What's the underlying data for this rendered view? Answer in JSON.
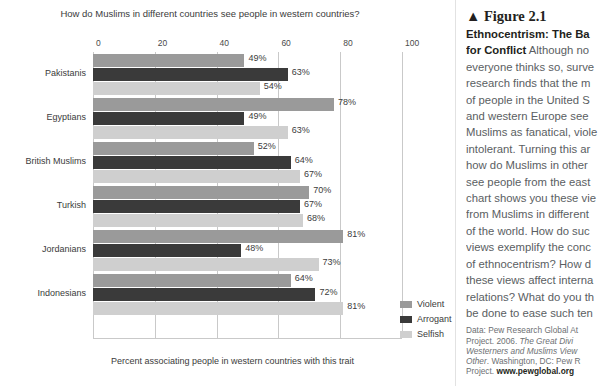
{
  "chart_data": {
    "type": "bar",
    "orientation": "horizontal",
    "title": "How do Muslims in different countries see people in western countries?",
    "xlabel": "Percent associating people in western countries with this trait",
    "ylabel": "",
    "xlim": [
      0,
      100
    ],
    "xticks": [
      0,
      20,
      40,
      60,
      80,
      100
    ],
    "xtick_labels": [
      "0",
      "20",
      "40",
      "60",
      "80",
      "100"
    ],
    "grid": true,
    "legend_position": "right-bottom",
    "categories": [
      "Pakistanis",
      "Egyptians",
      "British Muslims",
      "Turkish",
      "Jordanians",
      "Indonesians"
    ],
    "series": [
      {
        "name": "Violent",
        "color": "#9a9a9a",
        "values": [
          49,
          78,
          52,
          70,
          81,
          64
        ]
      },
      {
        "name": "Arrogant",
        "color": "#3a3a3a",
        "values": [
          63,
          49,
          64,
          67,
          48,
          72
        ]
      },
      {
        "name": "Selfish",
        "color": "#cfcfcf",
        "values": [
          54,
          63,
          67,
          68,
          73,
          81
        ]
      }
    ],
    "value_label_suffix": "%"
  },
  "figure": {
    "marker": "▲",
    "number_label": "Figure 2.1",
    "headline": "Ethnocentrism: The Ba",
    "headline_cont": "for Conflict",
    "body_lines": [
      "Although no",
      "everyone thinks so, surve",
      "research finds that the m",
      "of people in the United S",
      "and western Europe see",
      "Muslims as fanatical, viole",
      "intolerant. Turning this ar",
      "how do Muslims in other",
      "see people from the east",
      "chart shows you these vie",
      "from Muslims in different",
      "of the world. How do suc",
      "views exemplify the conc",
      "of ethnocentrism? How d",
      "these views affect interna",
      "relations? What do you th",
      "be done to ease such ten"
    ],
    "source_lines": [
      "Data: Pew Research Global At",
      "Project. 2006. ",
      "Westerners and Muslims View",
      "Other",
      ". Washington, DC: Pew R",
      "Project. ",
      "www.pewglobal.org"
    ],
    "source_italic_1": "The Great Divi",
    "source_project_prefix": "Project. 2006. "
  }
}
